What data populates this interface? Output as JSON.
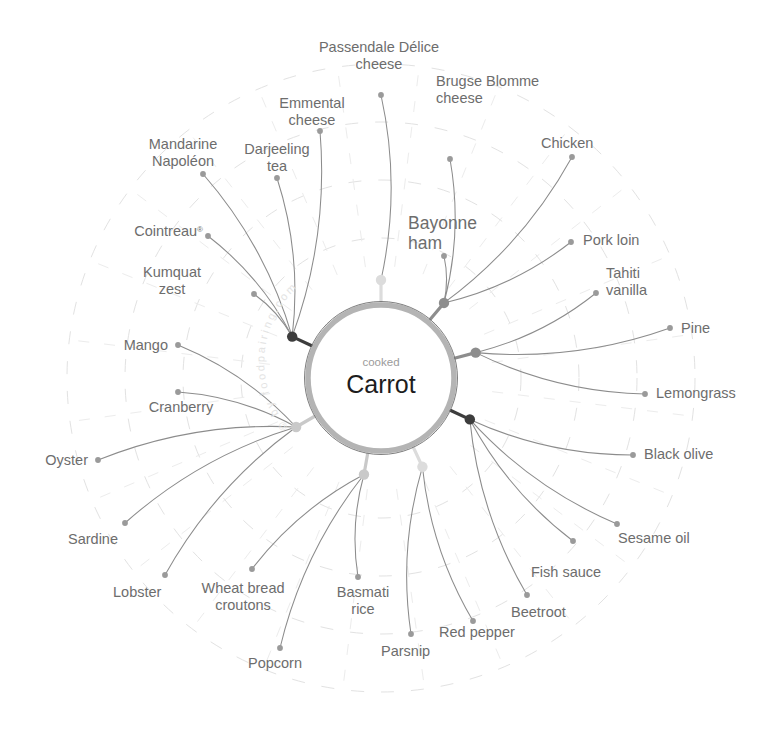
{
  "center": {
    "subtitle": "cooked",
    "title": "Carrot"
  },
  "watermark": {
    "text": "© by foodpairing.com"
  },
  "colors": {
    "edge": "#8c8c8c",
    "leaf_dot": "#9a9a9a",
    "label": "#6d6d6d",
    "ring_dashed": "#e2e2e2",
    "center_ring": "#b4b4b4",
    "hub_dark": "#3d3d3d",
    "hub_mid": "#8d8d8d",
    "hub_light": "#c9c9c9",
    "hub_pale": "#dcdcdc",
    "background": "#ffffff"
  },
  "chart_data": {
    "type": "radial-network",
    "center_label": "Carrot",
    "center_qualifier": "cooked",
    "hub_count": 8,
    "leaf_count": 28,
    "groups": [
      {
        "hub_id": "hub-top",
        "angle_deg": 270,
        "hub_radius": 98,
        "hub_shade": "pale",
        "members": [
          "Passendale Délice cheese"
        ]
      },
      {
        "hub_id": "hub-top-right",
        "angle_deg": 310,
        "hub_radius": 98,
        "hub_shade": "mid",
        "members": [
          "Brugse Blomme cheese",
          "Chicken",
          "Bayonne ham",
          "Pork loin"
        ]
      },
      {
        "hub_id": "hub-right-upper",
        "angle_deg": 345,
        "hub_radius": 98,
        "hub_shade": "mid",
        "members": [
          "Tahiti vanilla",
          "Pine",
          "Lemongrass"
        ]
      },
      {
        "hub_id": "hub-right-lower",
        "angle_deg": 25,
        "hub_radius": 98,
        "hub_shade": "dark",
        "members": [
          "Black olive",
          "Sesame oil",
          "Fish sauce",
          "Beetroot"
        ]
      },
      {
        "hub_id": "hub-bottom-right",
        "angle_deg": 65,
        "hub_radius": 98,
        "hub_shade": "pale",
        "members": [
          "Red pepper",
          "Parsnip"
        ]
      },
      {
        "hub_id": "hub-bottom",
        "angle_deg": 100,
        "hub_radius": 98,
        "hub_shade": "light",
        "members": [
          "Basmati rice",
          "Popcorn",
          "Wheat bread croutons"
        ]
      },
      {
        "hub_id": "hub-bottom-left",
        "angle_deg": 150,
        "hub_radius": 98,
        "hub_shade": "light",
        "members": [
          "Lobster",
          "Sardine",
          "Oyster",
          "Cranberry",
          "Mango"
        ]
      },
      {
        "hub_id": "hub-top-left",
        "angle_deg": 205,
        "hub_radius": 98,
        "hub_shade": "dark",
        "members": [
          "Kumquat zest",
          "Cointreau®",
          "Mandarine Napoléon",
          "Darjeeling tea",
          "Emmental cheese"
        ]
      }
    ],
    "nodes": [
      {
        "id": "passendale",
        "label_line1": "Passendale Délice",
        "label_line2": "cheese",
        "anchor": "middle",
        "dot": [
          381,
          95
        ],
        "label_x": 379,
        "label_y": 52,
        "hub": "hub-top",
        "size": "normal"
      },
      {
        "id": "brugse",
        "label_line1": "Brugse Blomme",
        "label_line2": "cheese",
        "anchor": "start",
        "dot": [
          450,
          159
        ],
        "label_x": 436,
        "label_y": 86,
        "hub": "hub-top-right",
        "size": "normal"
      },
      {
        "id": "chicken",
        "label_line1": "Chicken",
        "label_line2": "",
        "anchor": "start",
        "dot": [
          572,
          157
        ],
        "label_x": 541,
        "label_y": 148,
        "hub": "hub-top-right",
        "size": "normal"
      },
      {
        "id": "bayonne",
        "label_line1": "Bayonne",
        "label_line2": "ham",
        "anchor": "start",
        "dot": [
          444,
          256
        ],
        "label_x": 408,
        "label_y": 229,
        "hub": "hub-top-right",
        "size": "big"
      },
      {
        "id": "porkloin",
        "label_line1": "Pork loin",
        "label_line2": "",
        "anchor": "start",
        "dot": [
          571,
          242
        ],
        "label_x": 583,
        "label_y": 245,
        "hub": "hub-top-right",
        "size": "normal"
      },
      {
        "id": "tahiti",
        "label_line1": "Tahiti",
        "label_line2": "vanilla",
        "anchor": "start",
        "dot": [
          596,
          293
        ],
        "label_x": 606,
        "label_y": 278,
        "hub": "hub-right-upper",
        "size": "normal"
      },
      {
        "id": "pine",
        "label_line1": "Pine",
        "label_line2": "",
        "anchor": "start",
        "dot": [
          670,
          328
        ],
        "label_x": 681,
        "label_y": 333,
        "hub": "hub-right-upper",
        "size": "normal"
      },
      {
        "id": "lemongrass",
        "label_line1": "Lemongrass",
        "label_line2": "",
        "anchor": "start",
        "dot": [
          645,
          394
        ],
        "label_x": 656,
        "label_y": 398,
        "hub": "hub-right-upper",
        "size": "normal"
      },
      {
        "id": "blackolive",
        "label_line1": "Black olive",
        "label_line2": "",
        "anchor": "start",
        "dot": [
          633,
          455
        ],
        "label_x": 644,
        "label_y": 459,
        "hub": "hub-right-lower",
        "size": "normal"
      },
      {
        "id": "sesameoil",
        "label_line1": "Sesame oil",
        "label_line2": "",
        "anchor": "start",
        "dot": [
          617,
          524
        ],
        "label_x": 618,
        "label_y": 543,
        "hub": "hub-right-lower",
        "size": "normal"
      },
      {
        "id": "fishsauce",
        "label_line1": "Fish sauce",
        "label_line2": "",
        "anchor": "start",
        "dot": [
          573,
          541
        ],
        "label_x": 531,
        "label_y": 577,
        "hub": "hub-right-lower",
        "size": "normal"
      },
      {
        "id": "beetroot",
        "label_line1": "Beetroot",
        "label_line2": "",
        "anchor": "start",
        "dot": [
          527,
          595
        ],
        "label_x": 511,
        "label_y": 617,
        "hub": "hub-right-lower",
        "size": "normal"
      },
      {
        "id": "redpepper",
        "label_line1": "Red pepper",
        "label_line2": "",
        "anchor": "start",
        "dot": [
          473,
          621
        ],
        "label_x": 439,
        "label_y": 637,
        "hub": "hub-bottom-right",
        "size": "normal"
      },
      {
        "id": "parsnip",
        "label_line1": "Parsnip",
        "label_line2": "",
        "anchor": "start",
        "dot": [
          411,
          634
        ],
        "label_x": 381,
        "label_y": 656,
        "hub": "hub-bottom-right",
        "size": "normal"
      },
      {
        "id": "basmati",
        "label_line1": "Basmati",
        "label_line2": "rice",
        "anchor": "middle",
        "dot": [
          358,
          577
        ],
        "label_x": 363,
        "label_y": 597,
        "hub": "hub-bottom",
        "size": "normal"
      },
      {
        "id": "popcorn",
        "label_line1": "Popcorn",
        "label_line2": "",
        "anchor": "start",
        "dot": [
          280,
          648
        ],
        "label_x": 248,
        "label_y": 668,
        "hub": "hub-bottom",
        "size": "normal"
      },
      {
        "id": "wheatbread",
        "label_line1": "Wheat bread",
        "label_line2": "croutons",
        "anchor": "middle",
        "dot": [
          252,
          569
        ],
        "label_x": 243,
        "label_y": 593,
        "hub": "hub-bottom",
        "size": "normal"
      },
      {
        "id": "lobster",
        "label_line1": "Lobster",
        "label_line2": "",
        "anchor": "start",
        "dot": [
          165,
          575
        ],
        "label_x": 113,
        "label_y": 597,
        "hub": "hub-bottom-left",
        "size": "normal"
      },
      {
        "id": "sardine",
        "label_line1": "Sardine",
        "label_line2": "",
        "anchor": "start",
        "dot": [
          125,
          523
        ],
        "label_x": 68,
        "label_y": 544,
        "hub": "hub-bottom-left",
        "size": "normal"
      },
      {
        "id": "oyster",
        "label_line1": "Oyster",
        "label_line2": "",
        "anchor": "end",
        "dot": [
          98,
          460
        ],
        "label_x": 88,
        "label_y": 465,
        "hub": "hub-bottom-left",
        "size": "normal"
      },
      {
        "id": "cranberry",
        "label_line1": "Cranberry",
        "label_line2": "",
        "anchor": "middle",
        "dot": [
          178,
          392
        ],
        "label_x": 181,
        "label_y": 412,
        "hub": "hub-bottom-left",
        "size": "normal"
      },
      {
        "id": "mango",
        "label_line1": "Mango",
        "label_line2": "",
        "anchor": "end",
        "dot": [
          178,
          345
        ],
        "label_x": 168,
        "label_y": 350,
        "hub": "hub-bottom-left",
        "size": "normal"
      },
      {
        "id": "kumquat",
        "label_line1": "Kumquat",
        "label_line2": "zest",
        "anchor": "middle",
        "dot": [
          254,
          294
        ],
        "label_x": 172,
        "label_y": 277,
        "hub": "hub-top-left",
        "size": "normal"
      },
      {
        "id": "cointreau",
        "label_line1": "Cointreau",
        "label_line2": "",
        "anchor": "end",
        "dot": [
          208,
          236
        ],
        "label_x": 203,
        "label_y": 236,
        "hub": "hub-top-left",
        "size": "normal",
        "registered": true
      },
      {
        "id": "mandarine",
        "label_line1": "Mandarine",
        "label_line2": "Napoléon",
        "anchor": "middle",
        "dot": [
          203,
          174
        ],
        "label_x": 183,
        "label_y": 149,
        "hub": "hub-top-left",
        "size": "normal"
      },
      {
        "id": "darjeeling",
        "label_line1": "Darjeeling",
        "label_line2": "tea",
        "anchor": "middle",
        "dot": [
          277,
          178
        ],
        "label_x": 277,
        "label_y": 154,
        "hub": "hub-top-left",
        "size": "normal"
      },
      {
        "id": "emmental",
        "label_line1": "Emmental",
        "label_line2": "cheese",
        "anchor": "middle",
        "dot": [
          320,
          131
        ],
        "label_x": 312,
        "label_y": 108,
        "hub": "hub-top-left",
        "size": "normal"
      }
    ]
  }
}
